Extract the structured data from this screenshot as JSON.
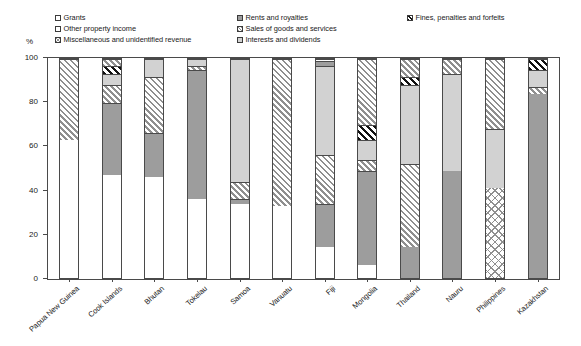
{
  "axis": {
    "y_unit": "%",
    "y_ticks": [
      0,
      20,
      40,
      60,
      80,
      100
    ],
    "y_min": 0,
    "y_max": 100
  },
  "legend": {
    "items": [
      {
        "label": "Grants",
        "pattern": "white"
      },
      {
        "label": "Other property income",
        "pattern": "white"
      },
      {
        "label": "Miscellaneous and unidentified revenue",
        "pattern": "cross"
      },
      {
        "label": "Rents and royalties",
        "pattern": "gray"
      },
      {
        "label": "Sales of goods and services",
        "pattern": "diag"
      },
      {
        "label": "Interests and dividends",
        "pattern": "lightgray"
      },
      {
        "label": "Fines, penalties and forfeits",
        "pattern": "blackdiag"
      }
    ]
  },
  "chart_data": {
    "type": "bar",
    "subtype": "stacked-bar-100",
    "title": "",
    "xlabel": "",
    "ylabel": "%",
    "ylim": [
      0,
      100
    ],
    "grid": false,
    "legend_position": "top",
    "categories": [
      "Papua New Guinea",
      "Cook Islands",
      "Bhutan",
      "Tokelau",
      "Samoa",
      "Vanuatu",
      "Fiji",
      "Mongolia",
      "Thailand",
      "Nauru",
      "Philippines",
      "Kazakhstan"
    ],
    "series": [
      {
        "name": "Grants",
        "pattern": "white",
        "values": [
          63,
          47,
          46,
          36,
          34,
          33,
          14,
          6,
          0,
          0,
          0,
          0
        ]
      },
      {
        "name": "Rents and royalties",
        "pattern": "gray",
        "values": [
          0,
          33,
          20,
          59,
          2,
          0,
          20,
          43,
          14,
          49,
          0,
          84
        ]
      },
      {
        "name": "Sales of goods and services",
        "pattern": "diag",
        "values": [
          37,
          8,
          26,
          2,
          8,
          67,
          22,
          5,
          38,
          0,
          0,
          3
        ]
      },
      {
        "name": "Interests and dividends",
        "pattern": "lightgray",
        "values": [
          0,
          5,
          8,
          3,
          56,
          0,
          41,
          9,
          36,
          44,
          27,
          8
        ]
      },
      {
        "name": "Fines, penalties and forfeits",
        "pattern": "blackdiag",
        "values": [
          0,
          4,
          0,
          0,
          0,
          0,
          0,
          7,
          4,
          0,
          0,
          5
        ]
      },
      {
        "name": "Other property income",
        "pattern": "white",
        "values": [
          0,
          0,
          0,
          0,
          0,
          0,
          3,
          0,
          0,
          0,
          0,
          0
        ]
      },
      {
        "name": "Miscellaneous and unidentified revenue",
        "pattern": "cross",
        "values": [
          0,
          0,
          0,
          0,
          0,
          0,
          0,
          0,
          0,
          0,
          41,
          0
        ]
      }
    ],
    "stacks": [
      {
        "category": "Papua New Guinea",
        "segments": [
          {
            "series": "Grants",
            "pattern": "white",
            "value": 63
          },
          {
            "series": "Sales of goods and services",
            "pattern": "diag",
            "value": 37
          }
        ]
      },
      {
        "category": "Cook Islands",
        "segments": [
          {
            "series": "Grants",
            "pattern": "white",
            "value": 47
          },
          {
            "series": "Rents and royalties",
            "pattern": "gray",
            "value": 33
          },
          {
            "series": "Sales of goods and services",
            "pattern": "diag",
            "value": 8
          },
          {
            "series": "Interests and dividends",
            "pattern": "lightgray",
            "value": 5
          },
          {
            "series": "Fines, penalties and forfeits",
            "pattern": "blackdiag",
            "value": 4
          },
          {
            "series": "Sales of goods and services",
            "pattern": "diag",
            "value": 3
          }
        ]
      },
      {
        "category": "Bhutan",
        "segments": [
          {
            "series": "Grants",
            "pattern": "white",
            "value": 46
          },
          {
            "series": "Rents and royalties",
            "pattern": "gray",
            "value": 20
          },
          {
            "series": "Sales of goods and services",
            "pattern": "diag",
            "value": 26
          },
          {
            "series": "Interests and dividends",
            "pattern": "lightgray",
            "value": 8
          }
        ]
      },
      {
        "category": "Tokelau",
        "segments": [
          {
            "series": "Grants",
            "pattern": "white",
            "value": 36
          },
          {
            "series": "Rents and royalties",
            "pattern": "gray",
            "value": 59
          },
          {
            "series": "Sales of goods and services",
            "pattern": "diag",
            "value": 2
          },
          {
            "series": "Interests and dividends",
            "pattern": "lightgray",
            "value": 3
          }
        ]
      },
      {
        "category": "Samoa",
        "segments": [
          {
            "series": "Grants",
            "pattern": "white",
            "value": 34
          },
          {
            "series": "Rents and royalties",
            "pattern": "gray",
            "value": 2
          },
          {
            "series": "Sales of goods and services",
            "pattern": "diag",
            "value": 8
          },
          {
            "series": "Interests and dividends",
            "pattern": "lightgray",
            "value": 56
          }
        ]
      },
      {
        "category": "Vanuatu",
        "segments": [
          {
            "series": "Grants",
            "pattern": "white",
            "value": 33
          },
          {
            "series": "Sales of goods and services",
            "pattern": "diag",
            "value": 67
          }
        ]
      },
      {
        "category": "Fiji",
        "segments": [
          {
            "series": "Grants",
            "pattern": "white",
            "value": 14
          },
          {
            "series": "Rents and royalties",
            "pattern": "gray",
            "value": 20
          },
          {
            "series": "Sales of goods and services",
            "pattern": "diag",
            "value": 22
          },
          {
            "series": "Interests and dividends",
            "pattern": "lightgray",
            "value": 41
          },
          {
            "series": "Rents and royalties",
            "pattern": "gray",
            "value": 2
          },
          {
            "series": "Other property income",
            "pattern": "white",
            "value": 1
          }
        ]
      },
      {
        "category": "Mongolia",
        "segments": [
          {
            "series": "Grants",
            "pattern": "white",
            "value": 6
          },
          {
            "series": "Rents and royalties",
            "pattern": "gray",
            "value": 43
          },
          {
            "series": "Sales of goods and services",
            "pattern": "diag",
            "value": 5
          },
          {
            "series": "Interests and dividends",
            "pattern": "lightgray",
            "value": 9
          },
          {
            "series": "Fines, penalties and forfeits",
            "pattern": "blackdiag",
            "value": 7
          },
          {
            "series": "Sales of goods and services",
            "pattern": "diag",
            "value": 30
          }
        ]
      },
      {
        "category": "Thailand",
        "segments": [
          {
            "series": "Rents and royalties",
            "pattern": "gray",
            "value": 14
          },
          {
            "series": "Sales of goods and services",
            "pattern": "diag",
            "value": 38
          },
          {
            "series": "Interests and dividends",
            "pattern": "lightgray",
            "value": 36
          },
          {
            "series": "Fines, penalties and forfeits",
            "pattern": "blackdiag",
            "value": 4
          },
          {
            "series": "Sales of goods and services",
            "pattern": "diag",
            "value": 8
          }
        ]
      },
      {
        "category": "Nauru",
        "segments": [
          {
            "series": "Rents and royalties",
            "pattern": "gray",
            "value": 49
          },
          {
            "series": "Interests and dividends",
            "pattern": "lightgray",
            "value": 44
          },
          {
            "series": "Sales of goods and services",
            "pattern": "diag",
            "value": 7
          }
        ]
      },
      {
        "category": "Philippines",
        "segments": [
          {
            "series": "Miscellaneous and unidentified revenue",
            "pattern": "cross",
            "value": 41
          },
          {
            "series": "Interests and dividends",
            "pattern": "lightgray",
            "value": 27
          },
          {
            "series": "Sales of goods and services",
            "pattern": "diag",
            "value": 32
          }
        ]
      },
      {
        "category": "Kazakhstan",
        "segments": [
          {
            "series": "Rents and royalties",
            "pattern": "gray",
            "value": 84
          },
          {
            "series": "Sales of goods and services",
            "pattern": "diag",
            "value": 3
          },
          {
            "series": "Interests and dividends",
            "pattern": "lightgray",
            "value": 8
          },
          {
            "series": "Fines, penalties and forfeits",
            "pattern": "blackdiag",
            "value": 5
          }
        ]
      }
    ]
  }
}
